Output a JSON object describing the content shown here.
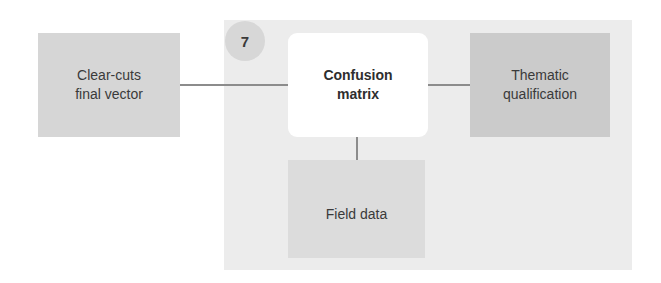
{
  "diagram": {
    "step_badge": "7",
    "nodes": {
      "input": "Clear-cuts\nfinal vector",
      "center": "Confusion\nmatrix",
      "output": "Thematic\nqualification",
      "field": "Field data"
    },
    "edges": [
      {
        "from": "input",
        "to": "center"
      },
      {
        "from": "center",
        "to": "output"
      },
      {
        "from": "center",
        "to": "field"
      }
    ]
  }
}
